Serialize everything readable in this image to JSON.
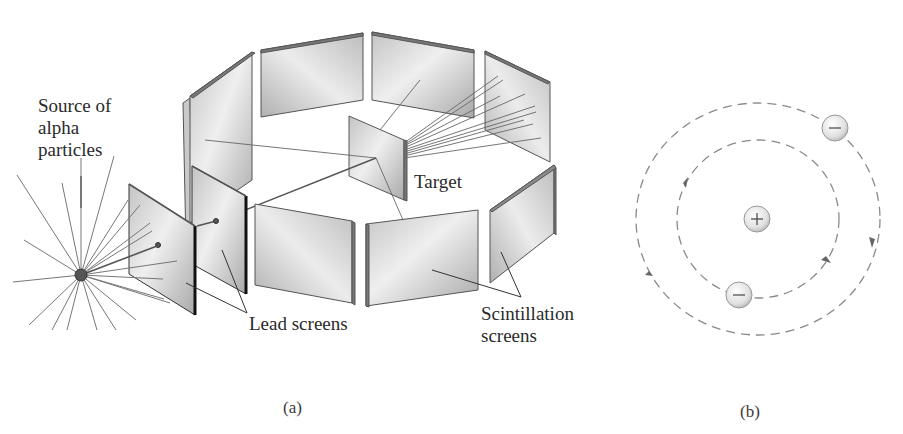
{
  "figure": {
    "panel_a": {
      "caption": "(a)",
      "labels": {
        "source_line1": "Source of",
        "source_line2": "alpha",
        "source_line3": "particles",
        "target": "Target",
        "lead_screens": "Lead screens",
        "scintillation_line1": "Scintillation",
        "scintillation_line2": "screens"
      },
      "components": [
        "alpha source",
        "lead screens (2)",
        "gold foil target",
        "scintillation screens ring"
      ]
    },
    "panel_b": {
      "caption": "(b)",
      "nucleus_symbol": "+",
      "electron_symbol": "−",
      "electrons": 2,
      "orbits": 2
    },
    "colors": {
      "line": "#555555",
      "screen_fill_light": "#f0f0f0",
      "screen_fill_dark": "#b8b8b8",
      "edge_dark": "#1a1a1a",
      "orbit_dash": "#8a8a8a"
    }
  }
}
